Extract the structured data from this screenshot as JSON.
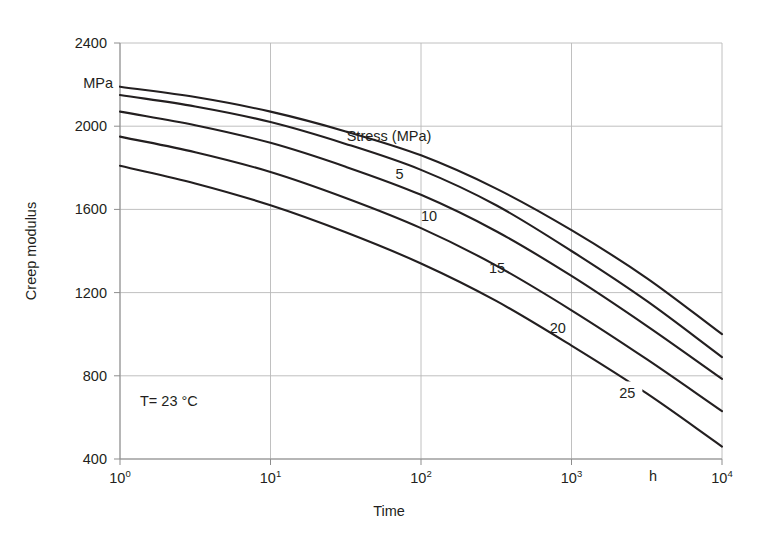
{
  "chart_data": {
    "type": "line",
    "title": "",
    "xlabel": "Time",
    "ylabel": "Creep modulus",
    "y_unit": "MPa",
    "x_unit": "h",
    "xscale": "log",
    "xlim": [
      1,
      10000
    ],
    "ylim": [
      400,
      2400
    ],
    "yticks": [
      400,
      800,
      1200,
      1600,
      2000,
      2400
    ],
    "ytick_labels": [
      "400",
      "800",
      "1200",
      "1600",
      "2000",
      "2400"
    ],
    "xticks": [
      1,
      10,
      100,
      1000,
      10000
    ],
    "xtick_labels": [
      "10",
      "10",
      "10",
      "10",
      "10"
    ],
    "xtick_exponents": [
      "0",
      "1",
      "2",
      "3",
      "4"
    ],
    "grid": true,
    "legend_title": "Stress (MPa)",
    "annotation": "T= 23 °C",
    "series": [
      {
        "name": "5",
        "label": "5",
        "x": [
          1,
          3.16,
          10,
          31.6,
          100,
          316,
          1000,
          3160,
          10000
        ],
        "y": [
          2190,
          2140,
          2070,
          1975,
          1860,
          1700,
          1500,
          1270,
          1000
        ]
      },
      {
        "name": "10",
        "label": "10",
        "x": [
          1,
          3.16,
          10,
          31.6,
          100,
          316,
          1000,
          3160,
          10000
        ],
        "y": [
          2150,
          2095,
          2020,
          1915,
          1790,
          1620,
          1400,
          1160,
          890
        ]
      },
      {
        "name": "15",
        "label": "15",
        "x": [
          1,
          3.16,
          10,
          31.6,
          100,
          316,
          1000,
          3160,
          10000
        ],
        "y": [
          2070,
          2005,
          1920,
          1805,
          1670,
          1495,
          1280,
          1040,
          785
        ]
      },
      {
        "name": "20",
        "label": "20",
        "x": [
          1,
          3.16,
          10,
          31.6,
          100,
          316,
          1000,
          3160,
          10000
        ],
        "y": [
          1950,
          1875,
          1780,
          1655,
          1510,
          1330,
          1115,
          880,
          630
        ]
      },
      {
        "name": "25",
        "label": "25",
        "x": [
          1,
          3.16,
          10,
          31.6,
          100,
          316,
          1000,
          3160,
          10000
        ],
        "y": [
          1810,
          1725,
          1620,
          1490,
          1340,
          1160,
          945,
          715,
          460
        ]
      }
    ],
    "series_label_positions": [
      {
        "label": "5",
        "x": 72,
        "y": 1775
      },
      {
        "label": "10",
        "x": 113,
        "y": 1570
      },
      {
        "label": "15",
        "x": 320,
        "y": 1320
      },
      {
        "label": "20",
        "x": 810,
        "y": 1030
      },
      {
        "label": "25",
        "x": 2350,
        "y": 720
      }
    ],
    "legend_title_pos": {
      "x": 135,
      "y": 1950
    },
    "annotation_pos": {
      "x": 1.55,
      "y": 545
    }
  },
  "axes": {
    "y_unit_label": "MPa",
    "x_unit_label": "h",
    "x_title": "Time",
    "y_title": "Creep modulus"
  },
  "colors": {
    "curve": "#231f20",
    "grid": "#b9b9b9",
    "axis": "#8d8d8d",
    "text": "#231f20",
    "background": "#ffffff"
  }
}
